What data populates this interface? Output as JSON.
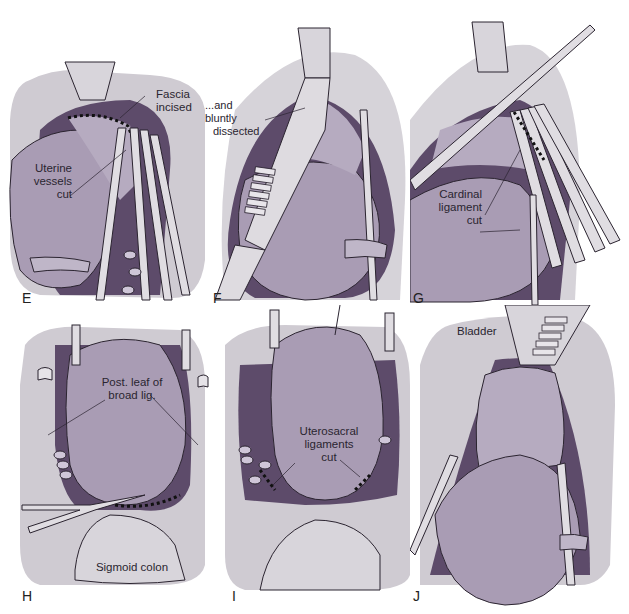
{
  "figure": {
    "panels": [
      {
        "id": "E",
        "letter": "E",
        "labels": [
          "Fascia\nincised",
          "Uterine\nvessels\ncut"
        ]
      },
      {
        "id": "F",
        "letter": "F",
        "labels": [
          "...and bluntly\ndissected"
        ]
      },
      {
        "id": "G",
        "letter": "G",
        "labels": [
          "Cardinal\nligament\ncut"
        ]
      },
      {
        "id": "H",
        "letter": "H",
        "labels": [
          "Post. leaf of\nbroad lig.",
          "Sigmoid colon"
        ]
      },
      {
        "id": "I",
        "letter": "I",
        "labels": [
          "Uterosacral\nligaments\ncut"
        ]
      },
      {
        "id": "J",
        "letter": "J",
        "labels": [
          "Bladder"
        ]
      }
    ]
  },
  "panelE": {
    "letter": "E",
    "fascia_l1": "Fascia",
    "fascia_l2": "incised",
    "vessels_l1": "Uterine",
    "vessels_l2": "vessels",
    "vessels_l3": "cut"
  },
  "panelF": {
    "letter": "F",
    "dissect_l1": "...and bluntly",
    "dissect_l2": "dissected"
  },
  "panelG": {
    "letter": "G",
    "cardinal_l1": "Cardinal",
    "cardinal_l2": "ligament",
    "cardinal_l3": "cut"
  },
  "panelH": {
    "letter": "H",
    "post_l1": "Post. leaf of",
    "post_l2": "broad lig.",
    "colon": "Sigmoid colon"
  },
  "panelI": {
    "letter": "I",
    "utero_l1": "Uterosacral",
    "utero_l2": "ligaments",
    "utero_l3": "cut"
  },
  "panelJ": {
    "letter": "J",
    "bladder": "Bladder"
  },
  "colors": {
    "tissue_gray": "#c9c6cc",
    "uterus_lavender": "#a89bb3",
    "cavity_purple": "#5d4b6a",
    "cervix_light": "#b8adc2",
    "instrument": "#d9d6da",
    "outline": "#2b2430"
  }
}
